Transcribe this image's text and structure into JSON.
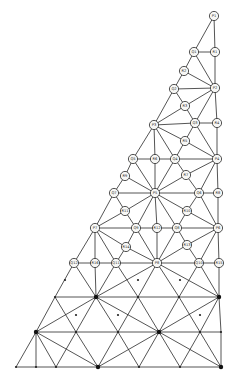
{
  "diagram": {
    "type": "triangular finite-element mesh",
    "colors": {
      "line": "#2a2a2a",
      "node_fill": "#f7f7f5",
      "background": "#ffffff"
    },
    "labeled_nodes": [
      {
        "id": "P1",
        "x": 214,
        "y": 16
      },
      {
        "id": "Q1",
        "x": 194,
        "y": 52
      },
      {
        "id": "R1",
        "x": 215,
        "y": 52
      },
      {
        "id": "R2",
        "x": 184,
        "y": 71
      },
      {
        "id": "Q2",
        "x": 174,
        "y": 89
      },
      {
        "id": "P2",
        "x": 215,
        "y": 88
      },
      {
        "id": "R3",
        "x": 185,
        "y": 106
      },
      {
        "id": "P3",
        "x": 154,
        "y": 125
      },
      {
        "id": "Q3",
        "x": 195,
        "y": 123
      },
      {
        "id": "R4",
        "x": 217,
        "y": 123
      },
      {
        "id": "R5",
        "x": 185,
        "y": 141
      },
      {
        "id": "Q5",
        "x": 133,
        "y": 159
      },
      {
        "id": "R6",
        "x": 155,
        "y": 159
      },
      {
        "id": "Q4",
        "x": 175,
        "y": 159
      },
      {
        "id": "P4",
        "x": 217,
        "y": 159
      },
      {
        "id": "R9",
        "x": 125,
        "y": 176
      },
      {
        "id": "R7",
        "x": 186,
        "y": 175
      },
      {
        "id": "Q7",
        "x": 114,
        "y": 193
      },
      {
        "id": "P5",
        "x": 155,
        "y": 193
      },
      {
        "id": "Q6",
        "x": 199,
        "y": 193
      },
      {
        "id": "R8",
        "x": 218,
        "y": 193
      },
      {
        "id": "R11",
        "x": 125,
        "y": 211
      },
      {
        "id": "R10",
        "x": 187,
        "y": 211
      },
      {
        "id": "P7",
        "x": 95,
        "y": 228
      },
      {
        "id": "Q9",
        "x": 136,
        "y": 228
      },
      {
        "id": "R12",
        "x": 157,
        "y": 228
      },
      {
        "id": "Q8",
        "x": 177,
        "y": 228
      },
      {
        "id": "P6",
        "x": 218,
        "y": 228
      },
      {
        "id": "R14",
        "x": 126,
        "y": 247
      },
      {
        "id": "R13",
        "x": 187,
        "y": 245
      },
      {
        "id": "Q12",
        "x": 74,
        "y": 263
      },
      {
        "id": "R16",
        "x": 95,
        "y": 263
      },
      {
        "id": "Q11",
        "x": 116,
        "y": 263
      },
      {
        "id": "P8",
        "x": 157,
        "y": 263
      },
      {
        "id": "Q10",
        "x": 199,
        "y": 263
      },
      {
        "id": "R15",
        "x": 219,
        "y": 263
      }
    ],
    "plain_nodes": [
      {
        "id": "a1",
        "x": 55,
        "y": 297,
        "big": false
      },
      {
        "id": "a2",
        "x": 96,
        "y": 297,
        "big": true
      },
      {
        "id": "a3",
        "x": 138,
        "y": 297,
        "big": false
      },
      {
        "id": "a4",
        "x": 179,
        "y": 297,
        "big": false
      },
      {
        "id": "a5",
        "x": 219,
        "y": 297,
        "big": true
      },
      {
        "id": "m1",
        "x": 65,
        "y": 280,
        "big": false
      },
      {
        "id": "m2",
        "x": 76,
        "y": 315,
        "big": false
      },
      {
        "id": "m3",
        "x": 118,
        "y": 315,
        "big": false
      },
      {
        "id": "m4",
        "x": 200,
        "y": 315,
        "big": false
      },
      {
        "id": "m5",
        "x": 138,
        "y": 280,
        "big": false
      },
      {
        "id": "m6",
        "x": 180,
        "y": 280,
        "big": false
      },
      {
        "id": "b1",
        "x": 36,
        "y": 332,
        "big": true
      },
      {
        "id": "b2",
        "x": 76,
        "y": 332,
        "big": false
      },
      {
        "id": "b3",
        "x": 118,
        "y": 332,
        "big": false
      },
      {
        "id": "b4",
        "x": 159,
        "y": 332,
        "big": true
      },
      {
        "id": "b5",
        "x": 200,
        "y": 332,
        "big": false
      },
      {
        "id": "b6",
        "x": 221,
        "y": 332,
        "big": false
      },
      {
        "id": "c1",
        "x": 16,
        "y": 367,
        "big": false
      },
      {
        "id": "c2",
        "x": 36,
        "y": 367,
        "big": false
      },
      {
        "id": "c3",
        "x": 56,
        "y": 367,
        "big": false
      },
      {
        "id": "c4",
        "x": 98,
        "y": 367,
        "big": true
      },
      {
        "id": "c5",
        "x": 139,
        "y": 367,
        "big": false
      },
      {
        "id": "c6",
        "x": 180,
        "y": 367,
        "big": false
      },
      {
        "id": "c7",
        "x": 221,
        "y": 367,
        "big": true
      }
    ],
    "edges": [
      [
        "P1",
        "Q1"
      ],
      [
        "P1",
        "R1"
      ],
      [
        "Q1",
        "R1"
      ],
      [
        "R1",
        "P2"
      ],
      [
        "Q1",
        "R2"
      ],
      [
        "Q1",
        "P2"
      ],
      [
        "R2",
        "Q2"
      ],
      [
        "R2",
        "P2"
      ],
      [
        "Q2",
        "P2"
      ],
      [
        "Q2",
        "R3"
      ],
      [
        "R3",
        "P2"
      ],
      [
        "Q2",
        "P3"
      ],
      [
        "R3",
        "P3"
      ],
      [
        "R3",
        "Q3"
      ],
      [
        "P2",
        "Q3"
      ],
      [
        "P2",
        "R4"
      ],
      [
        "Q3",
        "R4"
      ],
      [
        "P3",
        "Q3"
      ],
      [
        "R4",
        "P4"
      ],
      [
        "Q3",
        "P4"
      ],
      [
        "Q3",
        "R5"
      ],
      [
        "P3",
        "R5"
      ],
      [
        "R5",
        "Q4"
      ],
      [
        "R5",
        "P4"
      ],
      [
        "P3",
        "Q5"
      ],
      [
        "P3",
        "R6"
      ],
      [
        "P3",
        "Q4"
      ],
      [
        "Q5",
        "R6"
      ],
      [
        "R6",
        "Q4"
      ],
      [
        "Q4",
        "P4"
      ],
      [
        "Q5",
        "R9"
      ],
      [
        "Q5",
        "P5"
      ],
      [
        "R6",
        "P5"
      ],
      [
        "Q4",
        "P5"
      ],
      [
        "Q4",
        "R7"
      ],
      [
        "R7",
        "P4"
      ],
      [
        "R9",
        "Q7"
      ],
      [
        "R9",
        "P5"
      ],
      [
        "R7",
        "P5"
      ],
      [
        "R7",
        "Q6"
      ],
      [
        "P4",
        "Q6"
      ],
      [
        "P4",
        "R8"
      ],
      [
        "Q7",
        "P5"
      ],
      [
        "P5",
        "Q6"
      ],
      [
        "Q6",
        "R8"
      ],
      [
        "R8",
        "P6"
      ],
      [
        "Q6",
        "P6"
      ],
      [
        "Q7",
        "R11"
      ],
      [
        "Q7",
        "P7"
      ],
      [
        "R11",
        "P5"
      ],
      [
        "R11",
        "P7"
      ],
      [
        "R11",
        "Q9"
      ],
      [
        "P5",
        "Q9"
      ],
      [
        "P5",
        "R12"
      ],
      [
        "P5",
        "Q8"
      ],
      [
        "P5",
        "R10"
      ],
      [
        "Q6",
        "R10"
      ],
      [
        "R10",
        "Q8"
      ],
      [
        "R10",
        "P6"
      ],
      [
        "P7",
        "Q9"
      ],
      [
        "Q9",
        "R12"
      ],
      [
        "R12",
        "Q8"
      ],
      [
        "Q8",
        "P6"
      ],
      [
        "P7",
        "R14"
      ],
      [
        "Q9",
        "R14"
      ],
      [
        "R14",
        "P8"
      ],
      [
        "R14",
        "Q11"
      ],
      [
        "Q9",
        "P8"
      ],
      [
        "R12",
        "P8"
      ],
      [
        "Q8",
        "P8"
      ],
      [
        "Q8",
        "R13"
      ],
      [
        "R13",
        "P8"
      ],
      [
        "R13",
        "P6"
      ],
      [
        "R13",
        "Q10"
      ],
      [
        "P6",
        "Q10"
      ],
      [
        "P6",
        "R15"
      ],
      [
        "P7",
        "Q12"
      ],
      [
        "P7",
        "R16"
      ],
      [
        "P7",
        "Q11"
      ],
      [
        "Q12",
        "R16"
      ],
      [
        "R16",
        "Q11"
      ],
      [
        "Q11",
        "P8"
      ],
      [
        "P8",
        "Q10"
      ],
      [
        "Q10",
        "R15"
      ],
      [
        "Q12",
        "a1"
      ],
      [
        "Q12",
        "a2"
      ],
      [
        "R16",
        "a2"
      ],
      [
        "Q11",
        "a2"
      ],
      [
        "Q11",
        "a3"
      ],
      [
        "P8",
        "a2"
      ],
      [
        "P8",
        "a3"
      ],
      [
        "P8",
        "a4"
      ],
      [
        "P8",
        "a5"
      ],
      [
        "Q10",
        "a4"
      ],
      [
        "Q10",
        "a5"
      ],
      [
        "R15",
        "a5"
      ],
      [
        "a1",
        "a2"
      ],
      [
        "a2",
        "a3"
      ],
      [
        "a3",
        "a4"
      ],
      [
        "a4",
        "a5"
      ],
      [
        "a1",
        "b1"
      ],
      [
        "a1",
        "b2"
      ],
      [
        "a2",
        "b1"
      ],
      [
        "a2",
        "b2"
      ],
      [
        "a2",
        "b3"
      ],
      [
        "a2",
        "b4"
      ],
      [
        "a3",
        "b3"
      ],
      [
        "a3",
        "b4"
      ],
      [
        "a4",
        "b4"
      ],
      [
        "a4",
        "b5"
      ],
      [
        "a5",
        "b4"
      ],
      [
        "a5",
        "b5"
      ],
      [
        "a5",
        "b6"
      ],
      [
        "b1",
        "b2"
      ],
      [
        "b2",
        "b3"
      ],
      [
        "b3",
        "b4"
      ],
      [
        "b4",
        "b5"
      ],
      [
        "b5",
        "b6"
      ],
      [
        "b1",
        "c1"
      ],
      [
        "b1",
        "c2"
      ],
      [
        "b1",
        "c3"
      ],
      [
        "b1",
        "c4"
      ],
      [
        "b2",
        "c3"
      ],
      [
        "b2",
        "c4"
      ],
      [
        "b3",
        "c4"
      ],
      [
        "b3",
        "c5"
      ],
      [
        "b4",
        "c4"
      ],
      [
        "b4",
        "c5"
      ],
      [
        "b4",
        "c6"
      ],
      [
        "b4",
        "c7"
      ],
      [
        "b5",
        "c6"
      ],
      [
        "b5",
        "c7"
      ],
      [
        "b6",
        "c7"
      ],
      [
        "c1",
        "c2"
      ],
      [
        "c2",
        "c3"
      ],
      [
        "c3",
        "c4"
      ],
      [
        "c4",
        "c5"
      ],
      [
        "c5",
        "c6"
      ],
      [
        "c6",
        "c7"
      ]
    ]
  }
}
